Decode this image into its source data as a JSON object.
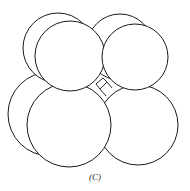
{
  "figure": {
    "caption": "(C)",
    "stroke_color": "#1a1a1a",
    "fill_color": "#ffffff",
    "spheres": [
      {
        "id": "back-bottom-left",
        "cx": 50,
        "cy": 114,
        "r": 42
      },
      {
        "id": "back-top-left",
        "cx": 58,
        "cy": 48,
        "r": 35
      },
      {
        "id": "back-top-right",
        "cx": 120,
        "cy": 47,
        "r": 33
      },
      {
        "id": "bottom-right",
        "cx": 138,
        "cy": 125,
        "r": 40
      },
      {
        "id": "front-bottom-left",
        "cx": 69,
        "cy": 125,
        "r": 42
      },
      {
        "id": "front-top-left",
        "cx": 70,
        "cy": 56,
        "r": 35
      },
      {
        "id": "front-top-right",
        "cx": 135,
        "cy": 57,
        "r": 33
      }
    ]
  }
}
